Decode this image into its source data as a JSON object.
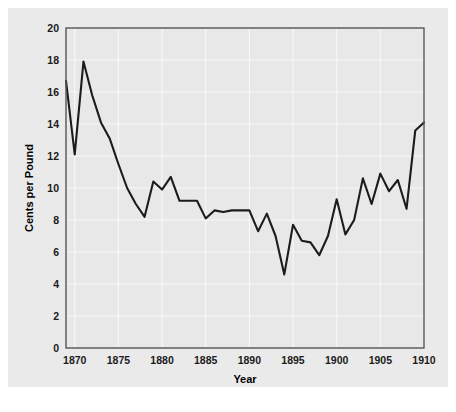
{
  "figure": {
    "background_color": "#ffffff",
    "panel_color": "#eaeaea",
    "plot_background_color": "#e8e8e8",
    "frame_color": "#555555",
    "gridline_color": "#f7f7f7",
    "line_color": "#1c1c1c"
  },
  "chart_data": {
    "type": "line",
    "title": "",
    "subtitle": "",
    "xlabel": "Year",
    "ylabel": "Cents per Pound",
    "xlim": [
      1869,
      1910
    ],
    "ylim": [
      0,
      20
    ],
    "xticks": [
      1870,
      1875,
      1880,
      1885,
      1890,
      1895,
      1900,
      1905,
      1910
    ],
    "xtick_labels": [
      "1870",
      "1875",
      "1880",
      "1885",
      "1890",
      "1895",
      "1900",
      "1905",
      "1910"
    ],
    "yticks": [
      0,
      2,
      4,
      6,
      8,
      10,
      12,
      14,
      16,
      18,
      20
    ],
    "ytick_labels": [
      "0",
      "2",
      "4",
      "6",
      "8",
      "10",
      "12",
      "14",
      "16",
      "18",
      "20"
    ],
    "grid": true,
    "legend": false,
    "legend_position": "none",
    "annotations": [],
    "x": [
      1869,
      1870,
      1871,
      1872,
      1873,
      1874,
      1875,
      1876,
      1877,
      1878,
      1879,
      1880,
      1881,
      1882,
      1883,
      1884,
      1885,
      1886,
      1887,
      1888,
      1889,
      1890,
      1891,
      1892,
      1893,
      1894,
      1895,
      1896,
      1897,
      1898,
      1899,
      1900,
      1901,
      1902,
      1903,
      1904,
      1905,
      1906,
      1907,
      1908,
      1909,
      1910
    ],
    "values": [
      16.7,
      12.1,
      17.9,
      15.8,
      14.1,
      13.1,
      11.5,
      10.0,
      9.0,
      8.2,
      10.4,
      9.9,
      10.7,
      9.2,
      9.2,
      9.2,
      8.1,
      8.6,
      8.5,
      8.6,
      8.6,
      8.6,
      7.3,
      8.4,
      7.0,
      4.6,
      7.7,
      6.7,
      6.6,
      5.8,
      7.0,
      9.3,
      7.1,
      8.0,
      10.6,
      9.0,
      10.9,
      9.8,
      10.5,
      8.7,
      13.6,
      14.1
    ],
    "series": [
      {
        "name": "Cotton price",
        "x": [
          1869,
          1870,
          1871,
          1872,
          1873,
          1874,
          1875,
          1876,
          1877,
          1878,
          1879,
          1880,
          1881,
          1882,
          1883,
          1884,
          1885,
          1886,
          1887,
          1888,
          1889,
          1890,
          1891,
          1892,
          1893,
          1894,
          1895,
          1896,
          1897,
          1898,
          1899,
          1900,
          1901,
          1902,
          1903,
          1904,
          1905,
          1906,
          1907,
          1908,
          1909,
          1910
        ],
        "values": [
          16.7,
          12.1,
          17.9,
          15.8,
          14.1,
          13.1,
          11.5,
          10.0,
          9.0,
          8.2,
          10.4,
          9.9,
          10.7,
          9.2,
          9.2,
          9.2,
          8.1,
          8.6,
          8.5,
          8.6,
          8.6,
          8.6,
          7.3,
          8.4,
          7.0,
          4.6,
          7.7,
          6.7,
          6.6,
          5.8,
          7.0,
          9.3,
          7.1,
          8.0,
          10.6,
          9.0,
          10.9,
          9.8,
          10.5,
          8.7,
          13.6,
          14.1
        ],
        "color": "#1c1c1c"
      }
    ]
  }
}
